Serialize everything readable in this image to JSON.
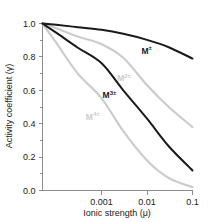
{
  "chart_data": {
    "type": "line",
    "title": "",
    "subtitle": "",
    "xlabel": "Ionic strength (μ)",
    "ylabel": "Activity coefficient (γ)",
    "xscale": "log",
    "yscale": "linear",
    "xlim": [
      5e-05,
      0.1
    ],
    "ylim": [
      0.0,
      1.0
    ],
    "grid": false,
    "legend_position": "inline-curve-labels",
    "x_tick_labels": [
      "0.001",
      "0.01",
      "0.1"
    ],
    "x_tick_values": [
      0.001,
      0.01,
      0.1
    ],
    "y_tick_labels": [
      "0.0",
      "0.2",
      "0.4",
      "0.6",
      "0.8",
      "1.0"
    ],
    "y_tick_values": [
      0.0,
      0.2,
      0.4,
      0.6,
      0.8,
      1.0
    ],
    "y_minor_tick_values": [
      0.1,
      0.3,
      0.5,
      0.7,
      0.9
    ],
    "x": [
      5e-05,
      0.0001,
      0.0003,
      0.001,
      0.003,
      0.01,
      0.03,
      0.1
    ],
    "series": [
      {
        "name": "M±",
        "label_base": "M",
        "label_sup": "±",
        "color": "#1a1a1a",
        "width": 2.0,
        "values": [
          1.0,
          0.992,
          0.978,
          0.962,
          0.938,
          0.902,
          0.858,
          0.79
        ],
        "value_at_0.001": 0.962,
        "value_at_0.01": 0.902,
        "value_at_0.1": 0.79,
        "label_x": 0.0075,
        "label_y": 0.82
      },
      {
        "name": "M2±",
        "label_base": "M",
        "label_sup": "2±",
        "color": "#cccccc",
        "width": 2.2,
        "values": [
          1.0,
          0.972,
          0.922,
          0.876,
          0.795,
          0.63,
          0.5,
          0.38
        ],
        "value_at_0.001": 0.876,
        "value_at_0.01": 0.63,
        "value_at_0.1": 0.38,
        "label_x": 0.0022,
        "label_y": 0.655
      },
      {
        "name": "M3±",
        "label_base": "M",
        "label_sup": "3±",
        "color": "#1a1a1a",
        "width": 2.0,
        "values": [
          1.0,
          0.945,
          0.855,
          0.762,
          0.6,
          0.43,
          0.265,
          0.12
        ],
        "value_at_0.001": 0.762,
        "value_at_0.01": 0.43,
        "value_at_0.1": 0.12,
        "label_x": 0.00105,
        "label_y": 0.555
      },
      {
        "name": "M4±",
        "label_base": "M",
        "label_sup": "4±",
        "color": "#cccccc",
        "width": 2.2,
        "values": [
          1.0,
          0.885,
          0.7,
          0.552,
          0.355,
          0.18,
          0.075,
          0.02
        ],
        "value_at_0.001": 0.552,
        "value_at_0.01": 0.18,
        "value_at_0.1": 0.02,
        "label_x": 0.00045,
        "label_y": 0.425
      }
    ]
  }
}
